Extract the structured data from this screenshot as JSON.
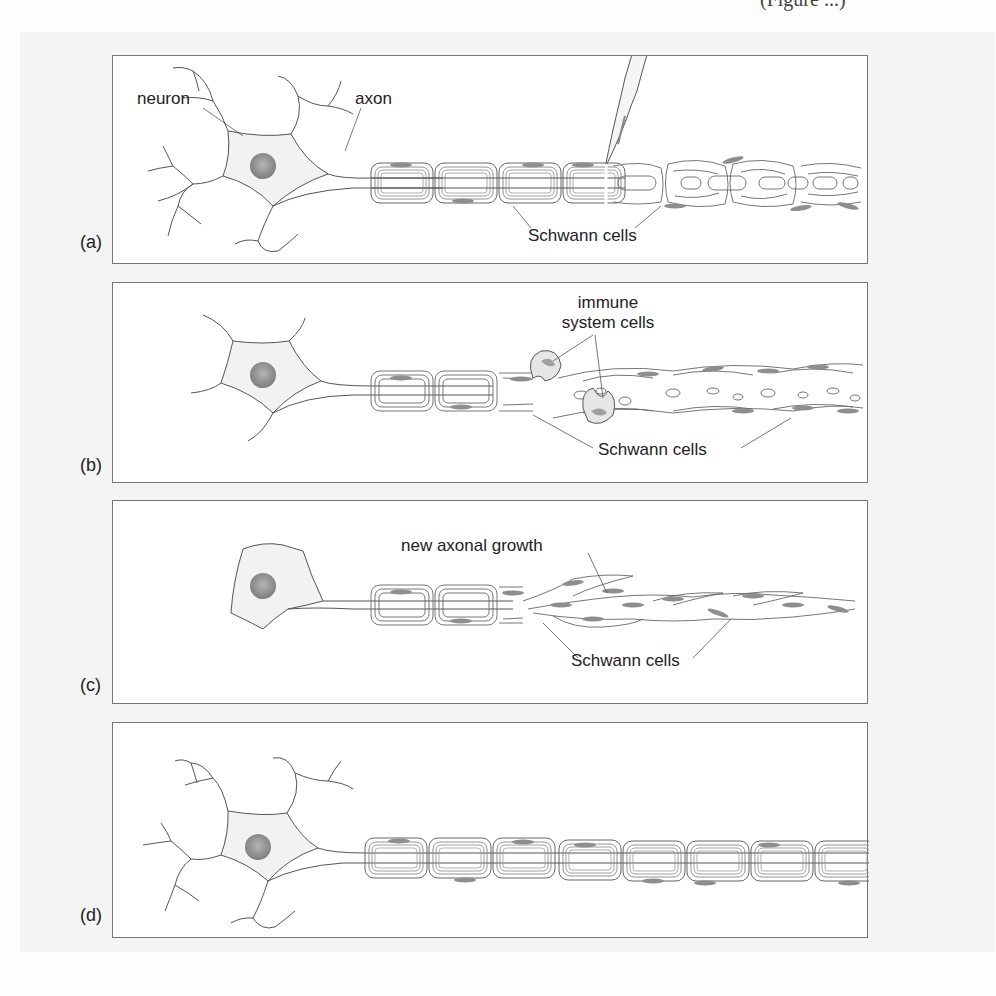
{
  "page": {
    "header_fragment": "(Figure ...)"
  },
  "figure": {
    "panels": [
      {
        "id": "a",
        "label": "(a)",
        "annotations": {
          "neuron": "neuron",
          "axon": "axon",
          "schwann": "Schwann cells"
        }
      },
      {
        "id": "b",
        "label": "(b)",
        "annotations": {
          "immune_line1": "immune",
          "immune_line2": "system cells",
          "schwann": "Schwann cells"
        }
      },
      {
        "id": "c",
        "label": "(c)",
        "annotations": {
          "growth": "new axonal growth",
          "schwann": "Schwann cells"
        }
      },
      {
        "id": "d",
        "label": "(d)",
        "annotations": {}
      }
    ],
    "colors": {
      "line": "#555555",
      "soma_fill": "#f3f3f3",
      "nucleus": "#8a8a8a",
      "schwann_nucleus": "#9a9a9a",
      "panel_border": "#777777"
    }
  }
}
